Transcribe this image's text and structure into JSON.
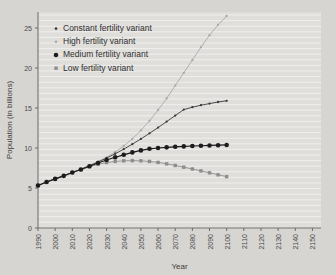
{
  "chart_data": {
    "type": "line",
    "title": "",
    "xlabel": "Year",
    "ylabel": "Population (in billions)",
    "xlim": [
      1990,
      2155
    ],
    "ylim": [
      0,
      27
    ],
    "xticks": [
      1990,
      2000,
      2010,
      2020,
      2030,
      2040,
      2050,
      2060,
      2070,
      2080,
      2090,
      2100,
      2110,
      2120,
      2130,
      2140,
      2150
    ],
    "yticks": [
      0,
      5,
      10,
      15,
      20,
      25
    ],
    "grid": "horizontal",
    "legend_position": "top-left",
    "x": [
      1990,
      1995,
      2000,
      2005,
      2010,
      2015,
      2020,
      2025,
      2030,
      2035,
      2040,
      2045,
      2050,
      2055,
      2060,
      2065,
      2070,
      2075,
      2080,
      2085,
      2090,
      2095,
      2100
    ],
    "series": [
      {
        "name": "Constant fertility variant",
        "color": "#3a3a3a",
        "marker": "small-dot",
        "values": [
          5.32,
          5.75,
          6.14,
          6.52,
          6.93,
          7.35,
          7.79,
          8.25,
          8.74,
          9.28,
          9.86,
          10.48,
          11.14,
          11.83,
          12.55,
          13.3,
          14.05,
          14.8,
          15.1,
          15.35,
          15.55,
          15.75,
          15.9
        ]
      },
      {
        "name": "High fertility variant",
        "color": "#a9a9a9",
        "marker": "small-dot",
        "values": [
          5.32,
          5.75,
          6.14,
          6.52,
          6.93,
          7.35,
          7.8,
          8.3,
          8.85,
          9.5,
          10.25,
          11.15,
          12.2,
          13.4,
          14.75,
          16.2,
          17.8,
          19.4,
          21.0,
          22.6,
          24.1,
          25.4,
          26.5
        ]
      },
      {
        "name": "Medium fertility variant",
        "color": "#1c1c1c",
        "marker": "large-dot",
        "values": [
          5.32,
          5.75,
          6.14,
          6.52,
          6.93,
          7.32,
          7.72,
          8.12,
          8.5,
          8.85,
          9.15,
          9.45,
          9.7,
          9.9,
          10.0,
          10.08,
          10.15,
          10.2,
          10.25,
          10.28,
          10.32,
          10.35,
          10.38
        ]
      },
      {
        "name": "Low fertility variant",
        "color": "#8d8d8d",
        "marker": "square",
        "values": [
          5.32,
          5.75,
          6.14,
          6.52,
          6.93,
          7.3,
          7.65,
          7.95,
          8.18,
          8.32,
          8.4,
          8.42,
          8.4,
          8.32,
          8.2,
          8.02,
          7.82,
          7.6,
          7.38,
          7.14,
          6.9,
          6.65,
          6.42
        ]
      }
    ]
  },
  "legend": {
    "items": [
      {
        "label": "Constant fertility variant"
      },
      {
        "label": "High fertility variant"
      },
      {
        "label": "Medium fertility variant"
      },
      {
        "label": "Low fertility variant"
      }
    ]
  }
}
